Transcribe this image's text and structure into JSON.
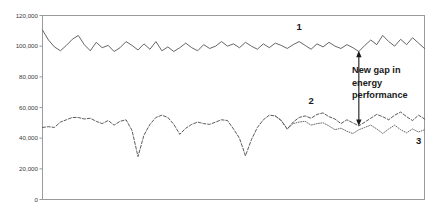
{
  "chart_data": {
    "type": "line",
    "title": "",
    "subtitle": "",
    "xlabel": "",
    "ylabel": "",
    "ylim": [
      0,
      120000
    ],
    "ytick_labels": [
      "120,000",
      "100,000",
      "80,000",
      "60,000",
      "40,000",
      "20,000",
      "0"
    ],
    "ytick_values": [
      120000,
      100000,
      80000,
      60000,
      40000,
      20000,
      0
    ],
    "xtick_labels": [],
    "grid": false,
    "legend_position": "inline-labels",
    "annotations": [
      {
        "name": "new-gap-annotation",
        "text_lines": [
          "New gap in",
          "energy",
          "performance"
        ],
        "text": "New gap in energy performance",
        "arrow": "double-headed-vertical",
        "arrow_x_index": 53,
        "arrow_y_top": 97000,
        "arrow_y_bottom": 48000
      }
    ],
    "series": [
      {
        "name": "1",
        "label": "1",
        "style": "solid",
        "color": "#555555",
        "label_x_index": 43,
        "label_y": 110500,
        "values": [
          110500,
          104000,
          99500,
          97000,
          100500,
          104500,
          107000,
          101000,
          97000,
          102500,
          99000,
          100500,
          96500,
          99000,
          103000,
          100500,
          97500,
          101500,
          98000,
          103000,
          97000,
          99500,
          96500,
          99000,
          102000,
          99000,
          97000,
          101000,
          98500,
          100000,
          103000,
          100000,
          101500,
          99000,
          102500,
          100000,
          98000,
          101500,
          99000,
          102000,
          100500,
          98500,
          101000,
          103000,
          100500,
          98000,
          101500,
          99500,
          102500,
          100000,
          98500,
          101000,
          99000,
          96500,
          100500,
          104000,
          101000,
          107000,
          103000,
          100000,
          104500,
          101000,
          105500,
          102000,
          98500
        ]
      },
      {
        "name": "2",
        "label": "2",
        "style": "dashed",
        "color": "#4a4a4a",
        "label_x_index": 45,
        "label_y": 62500,
        "values": [
          47000,
          47500,
          47000,
          50500,
          52000,
          53500,
          53500,
          52500,
          53000,
          51000,
          49500,
          51500,
          48500,
          51000,
          52000,
          45000,
          28000,
          42000,
          49000,
          53500,
          55000,
          53500,
          49000,
          42500,
          46500,
          49000,
          50500,
          49500,
          49000,
          50500,
          52000,
          51500,
          46000,
          40000,
          28500,
          39000,
          47000,
          52000,
          55000,
          54500,
          51500,
          46000,
          50500,
          53500,
          54500,
          53000,
          55500,
          56500,
          54000,
          52500,
          49500,
          52000,
          50000,
          48000,
          50500,
          53000,
          55500,
          54000,
          52000,
          55000,
          57000,
          54000,
          51500,
          55000,
          52500
        ]
      },
      {
        "name": "3",
        "label": "3",
        "style": "dotted",
        "color": "#5a5a5a",
        "label_x_index": 63,
        "label_y": 36500,
        "start_index": 39,
        "values": [
          54500,
          51500,
          46000,
          49500,
          50500,
          51000,
          48500,
          49500,
          50000,
          48000,
          45500,
          46500,
          44500,
          43000,
          45500,
          47000,
          48500,
          46000,
          43000,
          46000,
          48500,
          45500,
          43500,
          46000,
          44000,
          45500
        ]
      }
    ]
  }
}
